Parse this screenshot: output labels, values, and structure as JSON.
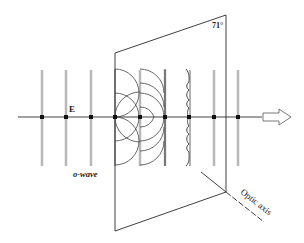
{
  "diagram": {
    "type": "physics-optics",
    "labels": {
      "field": "E",
      "wave": "o-wave",
      "angle": "71°",
      "axis": "Optic axis"
    },
    "colors": {
      "line": "#2a2a2a",
      "wavefront_bar": "#b8b8b8",
      "background": "#ffffff"
    },
    "wavefront_bars_x": [
      42,
      66,
      91,
      115,
      140,
      165,
      189,
      214,
      238
    ],
    "propagation_arrow": "right-arrow-outline"
  }
}
